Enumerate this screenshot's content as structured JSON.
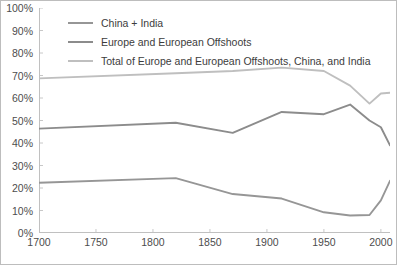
{
  "chart_data": {
    "type": "line",
    "title": "",
    "xlabel": "",
    "ylabel": "",
    "xlim": [
      1700,
      2008
    ],
    "ylim": [
      0,
      100
    ],
    "grid": false,
    "legend_position": "top-center",
    "y_tick_labels": [
      "100%",
      "90%",
      "80%",
      "70%",
      "60%",
      "50%",
      "40%",
      "30%",
      "20%",
      "10%",
      "0%"
    ],
    "y_tick_values": [
      100,
      90,
      80,
      70,
      60,
      50,
      40,
      30,
      20,
      10,
      0
    ],
    "x_tick_labels": [
      "1700",
      "1750",
      "1800",
      "1850",
      "1900",
      "1950",
      "2000"
    ],
    "x_tick_values": [
      1700,
      1750,
      1800,
      1850,
      1900,
      1950,
      2000
    ],
    "series": [
      {
        "name": "China + India",
        "color": "#969696",
        "x": [
          1700,
          1820,
          1870,
          1913,
          1950,
          1973,
          1990,
          2000,
          2008
        ],
        "values": [
          22.3,
          24.4,
          17.3,
          15.3,
          9.2,
          7.8,
          8.0,
          14.5,
          23.2
        ]
      },
      {
        "name": "Europe and European Offshoots",
        "color": "#8c8c8c",
        "x": [
          1700,
          1820,
          1870,
          1913,
          1950,
          1973,
          1990,
          2000,
          2008
        ],
        "values": [
          46.4,
          49.0,
          44.5,
          53.8,
          52.8,
          57.1,
          50.0,
          47.0,
          39.0
        ]
      },
      {
        "name": "Total of Europe and European Offshoots, China, and India",
        "color": "#bfbfbf",
        "x": [
          1700,
          1820,
          1870,
          1913,
          1950,
          1973,
          1990,
          2000,
          2008
        ],
        "values": [
          68.7,
          71.0,
          72.0,
          73.5,
          72.0,
          65.5,
          57.5,
          62.0,
          62.3
        ]
      }
    ]
  },
  "legend": {
    "items": [
      {
        "label": "China + India",
        "color": "#969696"
      },
      {
        "label": "Europe and European Offshoots",
        "color": "#8c8c8c"
      },
      {
        "label": "Total of Europe and European Offshoots, China, and India",
        "color": "#bfbfbf"
      }
    ]
  }
}
